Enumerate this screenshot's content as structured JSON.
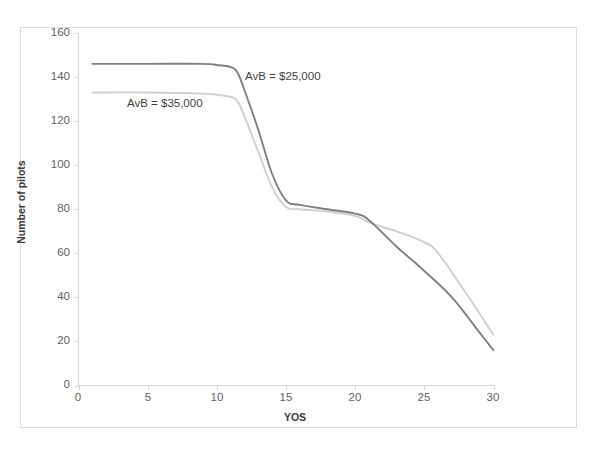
{
  "chart_data": {
    "type": "line",
    "title": "AvB = $15,000",
    "xlabel": "YOS",
    "ylabel": "Number of pilots",
    "xlim": [
      0,
      30
    ],
    "ylim": [
      0,
      160
    ],
    "xticks": [
      0,
      5,
      10,
      15,
      20,
      25,
      30
    ],
    "yticks": [
      0,
      20,
      40,
      60,
      80,
      100,
      120,
      140,
      160
    ],
    "grid": false,
    "legend_position": "inline-annotations",
    "series": [
      {
        "name": "AvB = $25,000",
        "color": "#7f7f7f",
        "annotation": "AvB = $25,000",
        "x": [
          1,
          5,
          9,
          10,
          11,
          11.5,
          12,
          13,
          14,
          15,
          16,
          18,
          20,
          21,
          23,
          25,
          27,
          29,
          30
        ],
        "values": [
          146,
          146,
          146,
          145.5,
          144.5,
          142,
          134,
          116,
          96,
          84,
          82,
          80,
          78,
          75,
          63,
          52,
          40,
          24,
          16
        ]
      },
      {
        "name": "AvB = $35,000",
        "color": "#cfcfcf",
        "annotation": "AvB = $35,000",
        "x": [
          1,
          5,
          9,
          10,
          11,
          11.5,
          12,
          13,
          14,
          15,
          16,
          18,
          20,
          21,
          23,
          25,
          26,
          28,
          30
        ],
        "values": [
          133,
          133,
          132.5,
          132,
          131,
          129,
          122,
          106,
          90,
          81,
          80,
          79,
          77,
          74,
          70,
          65,
          60,
          42,
          23
        ]
      }
    ],
    "annotations": [
      {
        "text": "AvB = $25,000",
        "x_px": 245,
        "y_px": 70
      },
      {
        "text": "AvB = $35,000",
        "x_px": 127,
        "y_px": 97
      }
    ]
  },
  "axis": {
    "y_title": "Number of pilots",
    "x_title": "YOS",
    "y_tick_labels": [
      "160",
      "140",
      "120",
      "100",
      "80",
      "60",
      "40",
      "20",
      "0"
    ],
    "x_tick_labels": [
      "0",
      "5",
      "10",
      "15",
      "20",
      "25",
      "30"
    ]
  },
  "title": {
    "text": "AvB = $15,000"
  },
  "colors": {
    "series_dark": "#7f7f7f",
    "series_light": "#cfcfcf",
    "axis": "#d4d4d4",
    "frame": "#dcdcdc",
    "tick_text": "#5f5f5f",
    "axis_title_text": "#3b3b3b",
    "background": "#ffffff"
  }
}
